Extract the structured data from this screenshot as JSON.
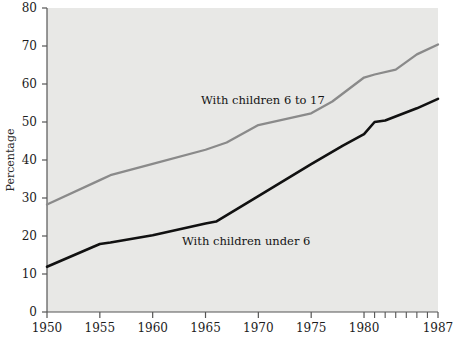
{
  "chart_data": {
    "type": "line",
    "title": "",
    "xlabel": "",
    "ylabel": "Percentage",
    "xlim": [
      1950,
      1987
    ],
    "ylim": [
      0,
      80
    ],
    "grid": false,
    "legend_position": "inline-annotations",
    "background_color": "#e8e8e6",
    "x_ticks_labeled": [
      "1950",
      "1955",
      "1960",
      "1965",
      "1970",
      "1975",
      "1980",
      "1987"
    ],
    "x_ticks_labeled_values": [
      1950,
      1955,
      1960,
      1965,
      1970,
      1975,
      1980,
      1987
    ],
    "x_ticks_minor_values": [
      1981,
      1982,
      1983,
      1984,
      1985,
      1986
    ],
    "y_ticks": [
      "0",
      "10",
      "20",
      "30",
      "40",
      "50",
      "60",
      "70",
      "80"
    ],
    "y_tick_values": [
      0,
      10,
      20,
      30,
      40,
      50,
      60,
      70,
      80
    ],
    "series": [
      {
        "name": "With children 6 to 17",
        "color": "#8a8a8a",
        "annotation": "With children 6 to 17",
        "x": [
          1950,
          1955,
          1956,
          1960,
          1965,
          1967,
          1970,
          1975,
          1977,
          1980,
          1981,
          1983,
          1985,
          1987
        ],
        "values": [
          28.3,
          34.7,
          36.0,
          39.0,
          42.7,
          44.6,
          49.2,
          52.3,
          55.4,
          61.7,
          62.5,
          63.8,
          67.8,
          70.4
        ]
      },
      {
        "name": "With children under 6",
        "color": "#111111",
        "annotation": "With children under 6",
        "x": [
          1950,
          1955,
          1956,
          1960,
          1965,
          1966,
          1970,
          1975,
          1978,
          1980,
          1981,
          1982,
          1985,
          1987
        ],
        "values": [
          11.9,
          17.9,
          18.3,
          20.2,
          23.3,
          23.8,
          30.5,
          38.9,
          43.8,
          46.8,
          50.0,
          50.4,
          53.6,
          56.1
        ]
      }
    ]
  },
  "annotations": {
    "series_1_label": "With children 6 to 17",
    "series_2_label": "With children under 6"
  },
  "axes": {
    "y_axis_title": "Percentage"
  }
}
